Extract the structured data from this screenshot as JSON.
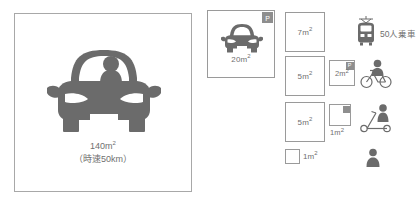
{
  "figure": {
    "type": "infographic",
    "topic": "transport-mode-space-occupancy",
    "colors": {
      "icon_fill": "#6b6b6b",
      "box_border": "#9a9a9a",
      "hero_border": "#a8a8a8",
      "badge_bg": "#8e8e8e",
      "text": "#6f6f6f",
      "background": "#ffffff"
    }
  },
  "hero": {
    "icon": "car-front-with-driver-icon",
    "area_label": "140m",
    "area_unit": "2",
    "speed_label": "（時速50km）"
  },
  "cards": [
    {
      "id": "car-parked",
      "icon": "car-front-icon",
      "badge": "P",
      "area_label": "20m",
      "area_unit": "2"
    }
  ],
  "rows": [
    {
      "id": "row-train",
      "square": {
        "area_label": "7m",
        "area_unit": "2",
        "badge": null
      },
      "square_small": null,
      "icon": "train-front-icon",
      "icon_label": "50人乗車"
    },
    {
      "id": "row-bicycle",
      "square": {
        "area_label": "5m",
        "area_unit": "2",
        "badge": null
      },
      "square_small": {
        "area_label": "2m",
        "area_unit": "2",
        "badge": "P"
      },
      "icon": "bicycle-with-rider-icon",
      "icon_label": ""
    },
    {
      "id": "row-scooter",
      "square": {
        "area_label": "5m",
        "area_unit": "2",
        "badge": null
      },
      "square_small": {
        "area_label": "1m",
        "area_unit": "2",
        "badge": "P"
      },
      "icon": "kick-scooter-with-rider-icon",
      "icon_label": ""
    },
    {
      "id": "row-pedestrian",
      "square": {
        "area_label": "1m",
        "area_unit": "2",
        "badge": null
      },
      "square_small": null,
      "icon": "pedestrian-icon",
      "icon_label": ""
    }
  ]
}
